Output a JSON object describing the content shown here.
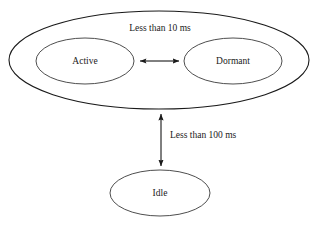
{
  "diagram": {
    "type": "state-transition-diagram",
    "background_color": "#ffffff",
    "stroke_color": "#1a1a1a",
    "text_color": "#1a1a1a",
    "groups": [
      {
        "id": "active-dormant-group",
        "label": "",
        "shape": "ellipse",
        "cx": 159,
        "cy": 60,
        "rx": 150,
        "ry": 49,
        "stroke_width": 1.1,
        "contains": [
          "active",
          "dormant"
        ]
      }
    ],
    "nodes": [
      {
        "id": "active",
        "label": "Active",
        "shape": "ellipse",
        "cx": 85,
        "cy": 61,
        "rx": 49,
        "ry": 23,
        "stroke_width": 0.9,
        "label_x": 85,
        "label_y": 61
      },
      {
        "id": "dormant",
        "label": "Dormant",
        "shape": "ellipse",
        "cx": 233,
        "cy": 61,
        "rx": 49,
        "ry": 23,
        "stroke_width": 0.9,
        "label_x": 233,
        "label_y": 61
      },
      {
        "id": "idle",
        "label": "Idle",
        "shape": "ellipse",
        "cx": 160,
        "cy": 193,
        "rx": 50,
        "ry": 23,
        "stroke_width": 0.9,
        "label_x": 160,
        "label_y": 193
      }
    ],
    "edges": [
      {
        "id": "active-dormant-edge",
        "from": "active",
        "to": "dormant",
        "direction": "bidirectional",
        "label": "Less than 10 ms",
        "orientation": "horizontal",
        "x1": 137,
        "y1": 61,
        "x2": 182,
        "y2": 61,
        "stroke_width": 1.0,
        "label_x": 160,
        "label_y": 28
      },
      {
        "id": "group-idle-edge",
        "from": "active-dormant-group",
        "to": "idle",
        "direction": "bidirectional",
        "label": "Less than 100 ms",
        "orientation": "vertical",
        "x1": 161,
        "y1": 111,
        "x2": 161,
        "y2": 169,
        "stroke_width": 1.0,
        "label_x": 170,
        "label_y": 136
      }
    ]
  }
}
